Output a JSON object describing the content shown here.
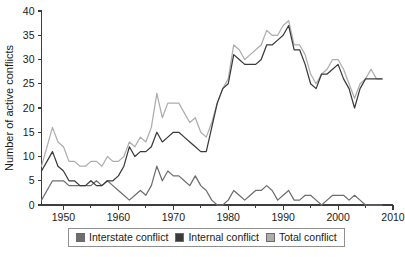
{
  "chart_data": {
    "type": "line",
    "title": "",
    "xlabel": "",
    "ylabel": "Number of active conflicts",
    "xlim": [
      1946,
      2010
    ],
    "ylim": [
      0,
      40
    ],
    "grid": false,
    "legend_position": "bottom",
    "x_ticks": [
      "1950",
      "1960",
      "1970",
      "1980",
      "1990",
      "2000",
      "2010"
    ],
    "x_tick_values": [
      1950,
      1960,
      1970,
      1980,
      1990,
      2000,
      2010
    ],
    "x_minor_tick_values": [
      1955,
      1965,
      1975,
      1985,
      1995,
      2005
    ],
    "y_ticks": [
      "0",
      "5",
      "10",
      "15",
      "20",
      "25",
      "30",
      "35",
      "40"
    ],
    "y_tick_values": [
      0,
      5,
      10,
      15,
      20,
      25,
      30,
      35,
      40
    ],
    "x": [
      1946,
      1947,
      1948,
      1949,
      1950,
      1951,
      1952,
      1953,
      1954,
      1955,
      1956,
      1957,
      1958,
      1959,
      1960,
      1961,
      1962,
      1963,
      1964,
      1965,
      1966,
      1967,
      1968,
      1969,
      1970,
      1971,
      1972,
      1973,
      1974,
      1975,
      1976,
      1977,
      1978,
      1979,
      1980,
      1981,
      1982,
      1983,
      1984,
      1985,
      1986,
      1987,
      1988,
      1989,
      1990,
      1991,
      1992,
      1993,
      1994,
      1995,
      1996,
      1997,
      1998,
      1999,
      2000,
      2001,
      2002,
      2003,
      2004,
      2005,
      2006,
      2007,
      2008
    ],
    "series": [
      {
        "name": "Interstate conflict",
        "color": "#6e6e6e",
        "values": [
          1,
          3,
          5,
          5,
          5,
          4,
          4,
          4,
          4,
          4,
          5,
          4,
          5,
          4,
          3,
          2,
          1,
          2,
          3,
          2,
          4,
          8,
          5,
          7,
          6,
          6,
          5,
          4,
          6,
          4,
          3,
          1,
          0,
          0,
          1,
          3,
          2,
          1,
          2,
          3,
          3,
          4,
          3,
          1,
          2,
          3,
          1,
          1,
          2,
          2,
          1,
          0,
          1,
          2,
          2,
          2,
          1,
          2,
          1,
          0,
          0,
          0,
          0
        ]
      },
      {
        "name": "Internal conflict",
        "color": "#3a3a3a",
        "values": [
          7,
          9,
          11,
          8,
          7,
          5,
          5,
          4,
          4,
          5,
          4,
          4,
          5,
          5,
          6,
          8,
          12,
          10,
          11,
          11,
          12,
          15,
          13,
          14,
          15,
          15,
          14,
          13,
          12,
          11,
          11,
          16,
          21,
          24,
          25,
          31,
          30,
          29,
          29,
          29,
          30,
          33,
          33,
          34,
          35,
          37,
          32,
          32,
          29,
          25,
          24,
          27,
          27,
          28,
          29,
          26,
          24,
          20,
          24,
          26,
          26,
          26,
          26
        ]
      },
      {
        "name": "Total conflict",
        "color": "#adadad",
        "values": [
          8,
          12,
          16,
          13,
          12,
          9,
          9,
          8,
          8,
          9,
          9,
          8,
          10,
          9,
          9,
          10,
          13,
          12,
          14,
          13,
          16,
          23,
          18,
          21,
          21,
          21,
          19,
          17,
          18,
          15,
          14,
          17,
          21,
          24,
          26,
          33,
          32,
          30,
          31,
          32,
          33,
          36,
          35,
          35,
          37,
          38,
          33,
          33,
          31,
          27,
          25,
          27,
          28,
          30,
          30,
          28,
          25,
          22,
          25,
          26,
          28,
          26,
          26
        ]
      }
    ],
    "legend": [
      {
        "label": "Interstate conflict",
        "color": "#6e6e6e"
      },
      {
        "label": "Internal conflict",
        "color": "#3a3a3a"
      },
      {
        "label": "Total conflict",
        "color": "#adadad"
      }
    ]
  },
  "colors": {
    "background": "#ffffff",
    "axis": "#3d3d3d",
    "text": "#1a1a1a",
    "legend_border": "#8f8f8f"
  }
}
